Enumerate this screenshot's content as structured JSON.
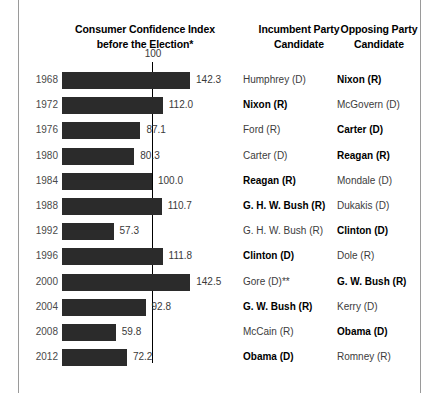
{
  "header": {
    "cci_title": "Consumer Confidence Index\nbefore the Election*",
    "cci_title_line1": "Consumer Confidence Index",
    "cci_title_line2": "before the Election*",
    "incumbent_title_line1": "Incumbent Party",
    "incumbent_title_line2": "Candidate",
    "opposing_title_line1": "Opposing Party",
    "opposing_title_line2": "Candidate"
  },
  "reference": {
    "label": "100",
    "value": 100
  },
  "colors": {
    "bar": "#2b2b2b",
    "reference_line": "#000000",
    "frame": "#9a9a9a",
    "text": "#3c3c3c",
    "winner_text": "#000000"
  },
  "chart_data": {
    "type": "bar",
    "orientation": "horizontal",
    "title": "Consumer Confidence Index before the Election*",
    "xlabel": "",
    "ylabel": "",
    "xlim": [
      0,
      150
    ],
    "grid": false,
    "legend": null,
    "reference_line": 100,
    "categories": [
      "1968",
      "1972",
      "1976",
      "1980",
      "1984",
      "1988",
      "1992",
      "1996",
      "2000",
      "2004",
      "2008",
      "2012"
    ],
    "values": [
      142.3,
      112.0,
      87.1,
      80.3,
      100.0,
      110.7,
      57.3,
      111.8,
      142.5,
      92.8,
      59.8,
      72.2
    ],
    "value_labels": [
      "142.3",
      "112.0",
      "87.1",
      "80.3",
      "100.0",
      "110.7",
      "57.3",
      "111.8",
      "142.5",
      "92.8",
      "59.8",
      "72.2"
    ],
    "annotations": [
      "100"
    ],
    "rows": [
      {
        "year": "1968",
        "value": 142.3,
        "value_label": "142.3",
        "incumbent": "Humphrey (D)",
        "incumbent_won": false,
        "opposing": "Nixon (R)",
        "opposing_won": true
      },
      {
        "year": "1972",
        "value": 112.0,
        "value_label": "112.0",
        "incumbent": "Nixon (R)",
        "incumbent_won": true,
        "opposing": "McGovern (D)",
        "opposing_won": false
      },
      {
        "year": "1976",
        "value": 87.1,
        "value_label": "87.1",
        "incumbent": "Ford (R)",
        "incumbent_won": false,
        "opposing": "Carter (D)",
        "opposing_won": true
      },
      {
        "year": "1980",
        "value": 80.3,
        "value_label": "80.3",
        "incumbent": "Carter (D)",
        "incumbent_won": false,
        "opposing": "Reagan (R)",
        "opposing_won": true
      },
      {
        "year": "1984",
        "value": 100.0,
        "value_label": "100.0",
        "incumbent": "Reagan (R)",
        "incumbent_won": true,
        "opposing": "Mondale (D)",
        "opposing_won": false
      },
      {
        "year": "1988",
        "value": 110.7,
        "value_label": "110.7",
        "incumbent": "G. H. W. Bush (R)",
        "incumbent_won": true,
        "opposing": "Dukakis (D)",
        "opposing_won": false
      },
      {
        "year": "1992",
        "value": 57.3,
        "value_label": "57.3",
        "incumbent": "G. H. W. Bush (R)",
        "incumbent_won": false,
        "opposing": "Clinton (D)",
        "opposing_won": true
      },
      {
        "year": "1996",
        "value": 111.8,
        "value_label": "111.8",
        "incumbent": "Clinton (D)",
        "incumbent_won": true,
        "opposing": "Dole (R)",
        "opposing_won": false
      },
      {
        "year": "2000",
        "value": 142.5,
        "value_label": "142.5",
        "incumbent": "Gore (D)**",
        "incumbent_won": false,
        "opposing": "G. W. Bush (R)",
        "opposing_won": true
      },
      {
        "year": "2004",
        "value": 92.8,
        "value_label": "92.8",
        "incumbent": "G. W. Bush (R)",
        "incumbent_won": true,
        "opposing": "Kerry (D)",
        "opposing_won": false
      },
      {
        "year": "2008",
        "value": 59.8,
        "value_label": "59.8",
        "incumbent": "McCain (R)",
        "incumbent_won": false,
        "opposing": "Obama (D)",
        "opposing_won": true
      },
      {
        "year": "2012",
        "value": 72.2,
        "value_label": "72.2",
        "incumbent": "Obama (D)",
        "incumbent_won": true,
        "opposing": "Romney (R)",
        "opposing_won": false
      }
    ]
  }
}
